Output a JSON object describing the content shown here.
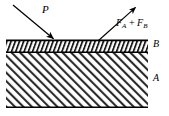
{
  "figure": {
    "name": "two-layer-slab-irradiation-diagram",
    "type": "physics-schematic",
    "width": 169,
    "height": 116,
    "background_color": "#ffffff",
    "line_color": "#000000",
    "hatch_color": "#000000"
  },
  "labels": {
    "incident": {
      "text": "P",
      "style": "italic",
      "meaning": "incident-power-arrow-label",
      "x": 42,
      "y": 4
    },
    "emitted": {
      "base_a": "F",
      "sub_a": "A",
      "operator": " + ",
      "base_b": "F",
      "sub_b": "B",
      "full_text": "FA + FB",
      "style": "italic",
      "meaning": "emitted-flux-sum-arrow-label",
      "x": 116,
      "y": 18
    },
    "layer_top": {
      "text": "B",
      "style": "italic",
      "meaning": "thin-upper-layer-label",
      "x": 153,
      "y": 39
    },
    "layer_bottom": {
      "text": "A",
      "style": "italic",
      "meaning": "thick-lower-layer-label",
      "x": 153,
      "y": 73
    }
  },
  "arrows": {
    "incident": {
      "name": "incident-power-arrow",
      "direction": "down-right",
      "x1": 13,
      "y1": 5,
      "x2": 55,
      "y2": 40
    },
    "emitted": {
      "name": "emitted-flux-arrow",
      "direction": "up-right",
      "x1": 98,
      "y1": 41,
      "x2": 137,
      "y2": 6
    }
  },
  "slab": {
    "left": 6,
    "right": 148,
    "layer_b": {
      "name": "layer-b-thin",
      "top": 40,
      "bottom": 52,
      "hatch": "dense-steep"
    },
    "layer_a": {
      "name": "layer-a-thick",
      "top": 52,
      "bottom": 108,
      "hatch": "diagonal-45"
    }
  }
}
